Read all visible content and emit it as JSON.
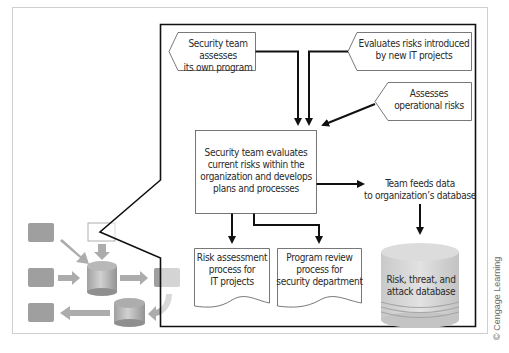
{
  "diagram": {
    "top_left_note": [
      "Security team assesses",
      "its own program"
    ],
    "top_right_note": [
      "Evaluates risks introduced",
      "by new IT projects"
    ],
    "right_note": [
      "Assesses",
      "operational risks"
    ],
    "center_box": [
      "Security team evaluates",
      "current risks within the",
      "organization and develops",
      "plans and processes"
    ],
    "feed_label": [
      "Team feeds data",
      "to organization’s database"
    ],
    "doc_left": [
      "Risk assessment",
      "process for",
      "IT projects"
    ],
    "doc_right": [
      "Program review",
      "process for",
      "security department"
    ],
    "database": [
      "Risk, threat, and",
      "attack database"
    ],
    "credit": "© Cengage Learning"
  },
  "colors": {
    "frame": "#111111",
    "outer_frame": "#cfcfcf",
    "thumb_gray": "#9a9a9a",
    "db_light": "#d8d8d8",
    "db_dark": "#b3b3b3"
  }
}
